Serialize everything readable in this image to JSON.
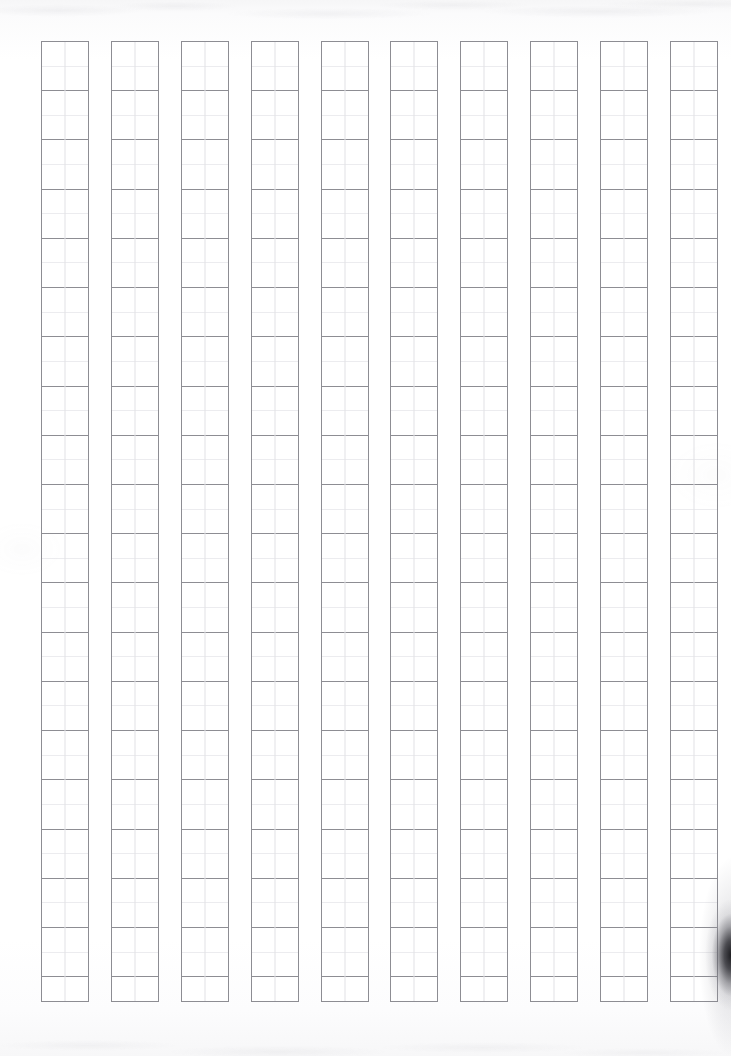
{
  "document": {
    "kind": "genkou-youshi-manuscript-paper",
    "title": "Blank Japanese manuscript paper scan",
    "orientation": "portrait",
    "page_width_px": 731,
    "page_height_px": 1056,
    "visible_text": "",
    "notes": "Scanned blank ruled sheet. No printed text, headings, page numbers or marks of any kind are visible."
  },
  "grid": {
    "columns": 10,
    "rows_per_column": 39,
    "cells_between_major_rules": 2,
    "column_width_px": 48,
    "column_gap_px": 22,
    "grid_left_px": 41,
    "grid_top_px": 41,
    "grid_width_px": 677,
    "grid_height_px": 961,
    "cell_height_px": 24.6,
    "has_center_vertical_hairline": true,
    "column_labels": [
      "column-1",
      "column-2",
      "column-3",
      "column-4",
      "column-5",
      "column-6",
      "column-7",
      "column-8",
      "column-9",
      "column-10"
    ]
  },
  "colors": {
    "paper": "#ffffff",
    "frame_rule": "#8d8d93",
    "major_rule": "#8d8d93",
    "minor_rule": "#ececef",
    "center_hairline": "#e2e2e6",
    "edge_shadow": "#141418",
    "scan_tint": "#f6f6f7"
  },
  "artifacts": {
    "top_edge_noise": "faint grey scanner speckle band along the top margin",
    "bottom_edge_noise": "faint grey scanner speckle band along the bottom margin",
    "right_edge_shadow": "dark page-curl / binding shadow on the lower right edge"
  }
}
